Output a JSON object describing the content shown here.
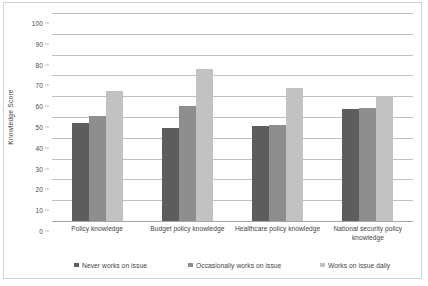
{
  "chart_data": {
    "type": "bar",
    "title": "",
    "xlabel": "",
    "ylabel": "Knowledge Score",
    "ylim": [
      0,
      100
    ],
    "yticks": [
      0,
      10,
      20,
      30,
      40,
      50,
      60,
      70,
      80,
      90,
      100
    ],
    "grid": true,
    "legend_position": "bottom",
    "categories": [
      "Policy knowledge",
      "Budget policy knowledge",
      "Healthcare policy knowledge",
      "National security policy knowledge"
    ],
    "series": [
      {
        "name": "Never works on issue",
        "color": "#5d5d5d",
        "values": [
          47,
          44.5,
          45.5,
          54
        ]
      },
      {
        "name": "Occasionally works on issue",
        "color": "#8e8e8e",
        "values": [
          50.5,
          55.5,
          46,
          54.5
        ]
      },
      {
        "name": "Works on issue daily",
        "color": "#c2c2c2",
        "values": [
          62.5,
          73,
          64,
          60
        ]
      }
    ]
  },
  "axis": {
    "y_title": "Knowledge Score",
    "y_ticks": [
      "0",
      "10",
      "20",
      "30",
      "40",
      "50",
      "60",
      "70",
      "80",
      "90",
      "100"
    ]
  },
  "legend": {
    "items": [
      {
        "label": "Never works on issue"
      },
      {
        "label": "Occasionally works on issue"
      },
      {
        "label": "Works on issue daily"
      }
    ]
  },
  "x_axis": {
    "labels": [
      "Policy knowledge",
      "Budget policy knowledge",
      "Healthcare policy knowledge",
      "National security policy knowledge"
    ]
  }
}
